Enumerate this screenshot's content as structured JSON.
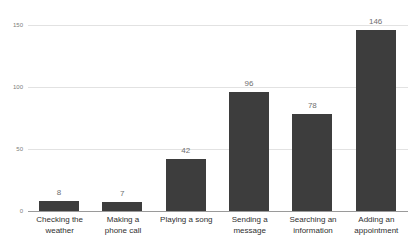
{
  "chart_data": {
    "type": "bar",
    "title": "",
    "subtitle": "",
    "xlabel": "",
    "ylabel": "",
    "categories": [
      "Checking the weather",
      "Making a phone call",
      "Playing a song",
      "Sending a message",
      "Searching an information",
      "Adding an appointment"
    ],
    "category_lines": [
      [
        "Checking the",
        "weather"
      ],
      [
        "Making a",
        "phone call"
      ],
      [
        "Playing a song"
      ],
      [
        "Sending a",
        "message"
      ],
      [
        "Searching an",
        "information"
      ],
      [
        "Adding an",
        "appointment"
      ]
    ],
    "values": [
      8,
      7,
      42,
      96,
      78,
      146
    ],
    "value_labels": [
      "8",
      "7",
      "42",
      "96",
      "78",
      "146"
    ],
    "ylim": [
      0,
      150
    ],
    "yticks": [
      0,
      50,
      100,
      150
    ],
    "ytick_labels": [
      "0",
      "50",
      "100",
      "150"
    ],
    "grid": true,
    "legend": false,
    "legend_position": "none",
    "colors": {
      "bar": "#3d3d3d",
      "gridline": "#e2e2e2",
      "axis": "#9a9a9a",
      "value_label": "#6f6f6f",
      "tick_label": "#7c7c7c",
      "category_label": "#2f2f2f",
      "background": "#ffffff"
    }
  }
}
